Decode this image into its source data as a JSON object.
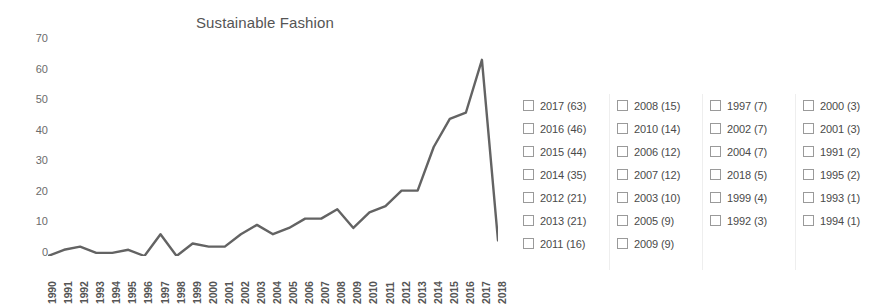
{
  "chart_data": {
    "type": "line",
    "title": "Sustainable Fashion",
    "xlabel": "",
    "ylabel": "",
    "ylim": [
      0,
      70
    ],
    "yticks": [
      70,
      60,
      50,
      40,
      30,
      20,
      10,
      0
    ],
    "grid": false,
    "legend_position": "right",
    "line_color": "#636363",
    "categories": [
      "1990",
      "1991",
      "1992",
      "1993",
      "1994",
      "1995",
      "1996",
      "1997",
      "1998",
      "1999",
      "2000",
      "2001",
      "2002",
      "2003",
      "2004",
      "2005",
      "2006",
      "2007",
      "2008",
      "2009",
      "2010",
      "2011",
      "2012",
      "2013",
      "2014",
      "2015",
      "2016",
      "2017",
      "2018"
    ],
    "values": [
      0,
      2,
      3,
      1,
      1,
      2,
      0,
      7,
      0,
      4,
      3,
      3,
      7,
      10,
      7,
      9,
      12,
      12,
      15,
      9,
      14,
      16,
      21,
      21,
      35,
      44,
      46,
      63,
      5
    ],
    "series": [
      {
        "name": "Sustainable Fashion",
        "values": [
          0,
          2,
          3,
          1,
          1,
          2,
          0,
          7,
          0,
          4,
          3,
          3,
          7,
          10,
          7,
          9,
          12,
          12,
          15,
          9,
          14,
          16,
          21,
          21,
          35,
          44,
          46,
          63,
          5
        ]
      }
    ]
  },
  "chart": {
    "title": "Sustainable Fashion",
    "y_ticks": [
      "70",
      "60",
      "50",
      "40",
      "30",
      "20",
      "10",
      "0"
    ],
    "x_ticks": [
      "1990",
      "1991",
      "1992",
      "1993",
      "1994",
      "1995",
      "1996",
      "1997",
      "1998",
      "1999",
      "2000",
      "2001",
      "2002",
      "2003",
      "2004",
      "2005",
      "2006",
      "2007",
      "2008",
      "2009",
      "2010",
      "2011",
      "2012",
      "2013",
      "2014",
      "2015",
      "2016",
      "2017",
      "2018"
    ]
  },
  "legend": {
    "columns": [
      {
        "items": [
          {
            "label": "2017 (63)",
            "year": "2017",
            "count": 63,
            "checked": false
          },
          {
            "label": "2016 (46)",
            "year": "2016",
            "count": 46,
            "checked": false
          },
          {
            "label": "2015 (44)",
            "year": "2015",
            "count": 44,
            "checked": false
          },
          {
            "label": "2014 (35)",
            "year": "2014",
            "count": 35,
            "checked": false
          },
          {
            "label": "2012 (21)",
            "year": "2012",
            "count": 21,
            "checked": false
          },
          {
            "label": "2013 (21)",
            "year": "2013",
            "count": 21,
            "checked": false
          },
          {
            "label": "2011 (16)",
            "year": "2011",
            "count": 16,
            "checked": false
          }
        ]
      },
      {
        "items": [
          {
            "label": "2008 (15)",
            "year": "2008",
            "count": 15,
            "checked": false
          },
          {
            "label": "2010 (14)",
            "year": "2010",
            "count": 14,
            "checked": false
          },
          {
            "label": "2006 (12)",
            "year": "2006",
            "count": 12,
            "checked": false
          },
          {
            "label": "2007 (12)",
            "year": "2007",
            "count": 12,
            "checked": false
          },
          {
            "label": "2003 (10)",
            "year": "2003",
            "count": 10,
            "checked": false
          },
          {
            "label": "2005 (9)",
            "year": "2005",
            "count": 9,
            "checked": false
          },
          {
            "label": "2009 (9)",
            "year": "2009",
            "count": 9,
            "checked": false
          }
        ]
      },
      {
        "items": [
          {
            "label": "1997 (7)",
            "year": "1997",
            "count": 7,
            "checked": false
          },
          {
            "label": "2002 (7)",
            "year": "2002",
            "count": 7,
            "checked": false
          },
          {
            "label": "2004 (7)",
            "year": "2004",
            "count": 7,
            "checked": false
          },
          {
            "label": "2018 (5)",
            "year": "2018",
            "count": 5,
            "checked": false
          },
          {
            "label": "1999 (4)",
            "year": "1999",
            "count": 4,
            "checked": false
          },
          {
            "label": "1992 (3)",
            "year": "1992",
            "count": 3,
            "checked": false
          }
        ]
      },
      {
        "items": [
          {
            "label": "2000 (3)",
            "year": "2000",
            "count": 3,
            "checked": false
          },
          {
            "label": "2001 (3)",
            "year": "2001",
            "count": 3,
            "checked": false
          },
          {
            "label": "1991 (2)",
            "year": "1991",
            "count": 2,
            "checked": false
          },
          {
            "label": "1995 (2)",
            "year": "1995",
            "count": 2,
            "checked": false
          },
          {
            "label": "1993 (1)",
            "year": "1993",
            "count": 1,
            "checked": false
          },
          {
            "label": "1994 (1)",
            "year": "1994",
            "count": 1,
            "checked": false
          }
        ]
      }
    ]
  }
}
